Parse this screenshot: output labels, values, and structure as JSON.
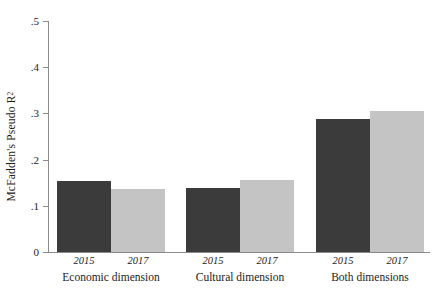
{
  "chart_data": {
    "type": "bar",
    "title": "",
    "xlabel": "",
    "ylabel": "McFadden's Pseudo R",
    "ylabel_superscript": "2",
    "ylim": [
      0,
      0.5
    ],
    "ytick_labels": [
      "0",
      ".1",
      ".2",
      ".3",
      ".4",
      ".5"
    ],
    "ytick_values": [
      0,
      0.1,
      0.2,
      0.3,
      0.4,
      0.5
    ],
    "grid": false,
    "legend": "none",
    "categories": [
      "Economic dimension",
      "Cultural dimension",
      "Both dimensions"
    ],
    "series": [
      {
        "name": "2015",
        "color": "#3b3b3b",
        "values": [
          0.154,
          0.138,
          0.288
        ]
      },
      {
        "name": "2017",
        "color": "#c4c4c4",
        "values": [
          0.136,
          0.156,
          0.305
        ]
      }
    ],
    "groups": [
      {
        "label": "Economic dimension",
        "bars": [
          {
            "series": "2015",
            "value": 0.154,
            "color": "#3b3b3b"
          },
          {
            "series": "2017",
            "value": 0.136,
            "color": "#c4c4c4"
          }
        ]
      },
      {
        "label": "Cultural dimension",
        "bars": [
          {
            "series": "2015",
            "value": 0.138,
            "color": "#3b3b3b"
          },
          {
            "series": "2017",
            "value": 0.156,
            "color": "#c4c4c4"
          }
        ]
      },
      {
        "label": "Both dimensions",
        "bars": [
          {
            "series": "2015",
            "value": 0.288,
            "color": "#3b3b3b"
          },
          {
            "series": "2017",
            "value": 0.305,
            "color": "#c4c4c4"
          }
        ]
      }
    ]
  },
  "axis": {
    "y_title_text": "McFadden's Pseudo R",
    "y_title_sup": "2",
    "ticks": [
      {
        "label": ".5"
      },
      {
        "label": ".4"
      },
      {
        "label": ".3"
      },
      {
        "label": ".2"
      },
      {
        "label": ".1"
      },
      {
        "label": "0"
      }
    ]
  },
  "colors": {
    "bar_2015": "#3b3b3b",
    "bar_2017": "#c4c4c4",
    "axis": "#8b8b8b",
    "text": "#1c1c1c",
    "background": "#ffffff"
  }
}
